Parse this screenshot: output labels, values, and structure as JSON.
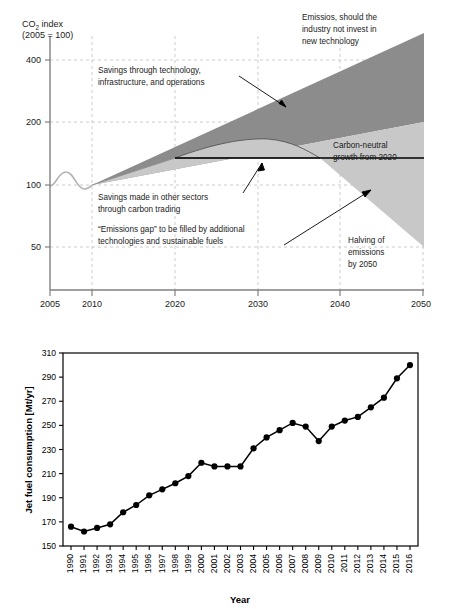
{
  "figures": {
    "top": {
      "y_axis_title_line1": "CO",
      "y_axis_title_sub": "2",
      "y_axis_title_line1b": " index",
      "y_axis_title_line2": "(2005 = 100)",
      "annotations": {
        "no_invest": "Emissios, should the\nindustry not invest in\nnew technology",
        "no_invest_l1": "Emissios, should the",
        "no_invest_l2": "industry not invest in",
        "no_invest_l3": "new technology",
        "tech_savings_l1": "Savings through technology,",
        "tech_savings_l2": "infrastructure, and operations",
        "carbon_neutral_l1": "Carbon-neutral",
        "carbon_neutral_l2": "growth from 2020",
        "other_sectors_l1": "Savings made in other sectors",
        "other_sectors_l2": "through carbon trading",
        "gap_l1": "“Emissions gap” to be filled by additional",
        "gap_l2": "technologies and sustainable fuels",
        "halving_l1": "Halving of",
        "halving_l2": "emissions",
        "halving_l3": "by 2050"
      },
      "colors": {
        "dark_band": "#8c8c8c",
        "light_band": "#c8c8c8",
        "baseline_curve": "#b3b3b3",
        "axis": "#808080",
        "grid": "#bfbfbf",
        "text": "#1a1a1a"
      },
      "chart_data": {
        "type": "area",
        "title": "",
        "xlabel": "",
        "ylabel": "CO2 index (2005 = 100)",
        "xlim": [
          2005,
          2050
        ],
        "ylim": [
          30,
          430
        ],
        "yscale": "log",
        "grid": true,
        "xticks": [
          2005,
          2010,
          2020,
          2030,
          2040,
          2050
        ],
        "yticks": [
          400,
          200,
          100,
          50
        ],
        "series": [
          {
            "name": "Emissions without technology investment (upper bound of dark band)",
            "x": [
              2010,
              2020,
              2030,
              2040,
              2050
            ],
            "values": [
              100,
              165,
              270,
              420,
              620
            ]
          },
          {
            "name": "Emissions after technology, infrastructure and operations savings (dark/light boundary)",
            "x": [
              2010,
              2020,
              2030,
              2040,
              2050
            ],
            "values": [
              100,
              120,
              145,
              172,
              205
            ]
          },
          {
            "name": "Historical / carbon-neutral growth line (black)",
            "x": [
              2005,
              2007,
              2010,
              2020,
              2030,
              2040,
              2050
            ],
            "values": [
              100,
              112,
              100,
              138,
              138,
              138,
              138
            ]
          },
          {
            "name": "Achievable path with carbon trading (upper edge of emissions gap)",
            "x": [
              2010,
              2020,
              2030,
              2033,
              2037,
              2040,
              2050
            ],
            "values": [
              100,
              125,
              148,
              150,
              138,
              120,
              52
            ]
          },
          {
            "name": "Halving of emissions by 2050 (lower bound of light band)",
            "x": [
              2005,
              2020,
              2037,
              2050
            ],
            "values": [
              100,
              138,
              138,
              52
            ]
          }
        ],
        "legend": []
      }
    },
    "bottom": {
      "ylabel": "Jet fuel consumption [Mt/yr]",
      "xlabel": "Year",
      "colors": {
        "line": "#000000",
        "marker": "#000000",
        "frame": "#000000"
      },
      "chart_data": {
        "type": "line",
        "title": "",
        "xlabel": "Year",
        "ylabel": "Jet fuel consumption [Mt/yr]",
        "ylim": [
          150,
          310
        ],
        "yticks": [
          150,
          170,
          190,
          210,
          230,
          250,
          270,
          290,
          310
        ],
        "grid": false,
        "categories": [
          "1990",
          "1991",
          "1992",
          "1993",
          "1994",
          "1995",
          "1996",
          "1997",
          "1998",
          "1999",
          "2000",
          "2001",
          "2002",
          "2003",
          "2004",
          "2005",
          "2006",
          "2007",
          "2008",
          "2009",
          "2010",
          "2011",
          "2012",
          "2013",
          "2014",
          "2015",
          "2016"
        ],
        "values": [
          166,
          162,
          165,
          168,
          178,
          184,
          192,
          197,
          202,
          208,
          219,
          216,
          216,
          216,
          231,
          240,
          246,
          252,
          249,
          237,
          249,
          254,
          257,
          265,
          273,
          289,
          300
        ],
        "legend": []
      }
    }
  }
}
